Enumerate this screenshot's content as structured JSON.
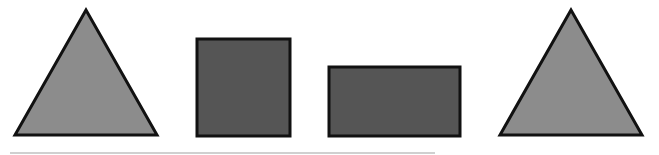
{
  "diagram": {
    "shapes": [
      {
        "id": "triangle-left",
        "type": "triangle",
        "fill": "#8c8c8c",
        "stroke": "#111111",
        "points": "86,10 15,135 157,135"
      },
      {
        "id": "square",
        "type": "square",
        "fill": "#555555",
        "stroke": "#111111",
        "x": 197,
        "y": 39,
        "width": 93,
        "height": 97
      },
      {
        "id": "rectangle",
        "type": "rectangle",
        "fill": "#555555",
        "stroke": "#111111",
        "x": 329,
        "y": 67,
        "width": 131,
        "height": 69
      },
      {
        "id": "triangle-right",
        "type": "triangle",
        "fill": "#8c8c8c",
        "stroke": "#111111",
        "points": "571,10 500,135 642,135"
      }
    ],
    "baseline": {
      "x1": 10,
      "x2": 435,
      "y": 153,
      "color": "#d0d0d0"
    }
  }
}
